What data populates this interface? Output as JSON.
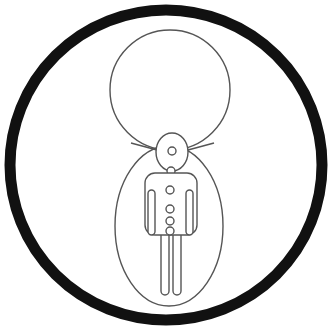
{
  "image": {
    "title": "Line drawing inside black circular border",
    "width": 334,
    "height": 333,
    "background_color": "#ffffff"
  },
  "palette": {
    "ink_black": "#111111",
    "line_gray": "#555555",
    "fill_white": "#ffffff"
  },
  "shapes": {
    "outer_ring": {
      "name": "outer-black-ring",
      "cx": 166,
      "cy": 165,
      "rx": 156,
      "ry": 155,
      "stroke": "#111111",
      "stroke_width": 11,
      "fill": "none"
    },
    "upper_circle": {
      "name": "large-thin-circle",
      "cx": 170,
      "cy": 90,
      "rx": 60,
      "ry": 60,
      "stroke": "#555555",
      "stroke_width": 1.4,
      "fill": "#ffffff"
    },
    "body_oval": {
      "name": "egg-body-oval",
      "cx": 169,
      "cy": 226,
      "rx": 54,
      "ry": 80,
      "stroke": "#555555",
      "stroke_width": 1.4,
      "fill": "#ffffff"
    },
    "head_oval": {
      "name": "small-head-oval",
      "cx": 172,
      "cy": 152,
      "rx": 16,
      "ry": 19,
      "stroke": "#555555",
      "stroke_width": 1.4,
      "fill": "#ffffff"
    },
    "head_dot": {
      "name": "head-inner-dot",
      "cx": 172,
      "cy": 151,
      "r": 4,
      "stroke": "#555555",
      "stroke_width": 1.4,
      "fill": "#ffffff"
    },
    "neck_dot": {
      "name": "neck-dot",
      "cx": 171,
      "cy": 171,
      "r": 4,
      "stroke": "#555555",
      "stroke_width": 1.4,
      "fill": "#ffffff"
    },
    "torso": {
      "name": "figure-torso",
      "x": 145,
      "y": 173,
      "width": 52,
      "height": 62,
      "corner_radius": 10,
      "stroke": "#555555",
      "stroke_width": 1.4,
      "fill": "#ffffff"
    },
    "arm_left": {
      "name": "figure-left-arm",
      "x": 148,
      "y": 190,
      "width": 7,
      "height": 45,
      "corner_radius": 3.5,
      "stroke": "#555555",
      "stroke_width": 1.4,
      "fill": "#ffffff"
    },
    "arm_right": {
      "name": "figure-right-arm",
      "x": 186,
      "y": 190,
      "width": 7,
      "height": 45,
      "corner_radius": 3.5,
      "stroke": "#555555",
      "stroke_width": 1.4,
      "fill": "#ffffff"
    },
    "leg_left": {
      "name": "figure-left-leg",
      "x": 161,
      "y": 231,
      "width": 8,
      "height": 64,
      "corner_radius": 4,
      "stroke": "#555555",
      "stroke_width": 1.4,
      "fill": "#ffffff"
    },
    "leg_right": {
      "name": "figure-right-leg",
      "x": 173,
      "y": 231,
      "width": 8,
      "height": 64,
      "corner_radius": 4,
      "stroke": "#555555",
      "stroke_width": 1.4,
      "fill": "#ffffff"
    }
  },
  "buttons": [
    {
      "name": "figure-button-1",
      "cx": 170,
      "cy": 190,
      "r": 4
    },
    {
      "name": "figure-button-2",
      "cx": 170,
      "cy": 209,
      "r": 4
    },
    {
      "name": "figure-button-3",
      "cx": 170,
      "cy": 221,
      "r": 4
    },
    {
      "name": "figure-button-4",
      "cx": 170,
      "cy": 231,
      "r": 4
    }
  ],
  "connector_lines": {
    "name": "shoulder-connector-lines",
    "left_path": "M 157 150 L 131 143",
    "right_path": "M 188 150 L 214 143"
  }
}
